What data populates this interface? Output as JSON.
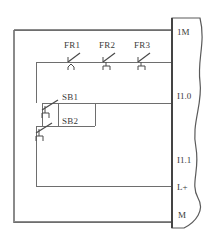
{
  "diagram": {
    "type": "electrical-schematic",
    "colors": {
      "wire": "#6e6e6e",
      "frame": "#8a8a8a",
      "module_outline": "#5a5a5a",
      "text": "#3a3a3a",
      "background": "#ffffff"
    },
    "contacts": [
      {
        "id": "FR1",
        "label": "FR1",
        "kind": "thermal-overload-nc",
        "x": 75,
        "y": 58
      },
      {
        "id": "FR2",
        "label": "FR2",
        "kind": "thermal-overload-nc",
        "x": 110,
        "y": 58
      },
      {
        "id": "FR3",
        "label": "FR3",
        "kind": "thermal-overload-nc",
        "x": 145,
        "y": 58
      }
    ],
    "buttons": [
      {
        "id": "SB1",
        "label": "SB1",
        "kind": "pushbutton-no",
        "x": 55,
        "y": 105
      },
      {
        "id": "SB2",
        "label": "SB2",
        "kind": "pushbutton-no",
        "x": 55,
        "y": 128
      }
    ],
    "module": {
      "name": "plc-input-module",
      "terminals": [
        {
          "id": "1M",
          "label": "1M",
          "connected": true,
          "y": 32
        },
        {
          "id": "I1.0",
          "label": "I1.0",
          "connected": true,
          "y": 96
        },
        {
          "id": "I1.1",
          "label": "I1.1",
          "connected": false,
          "y": 160
        },
        {
          "id": "L+",
          "label": "L+",
          "connected": true,
          "y": 186
        },
        {
          "id": "M",
          "label": "M",
          "connected": true,
          "y": 214
        }
      ]
    }
  }
}
